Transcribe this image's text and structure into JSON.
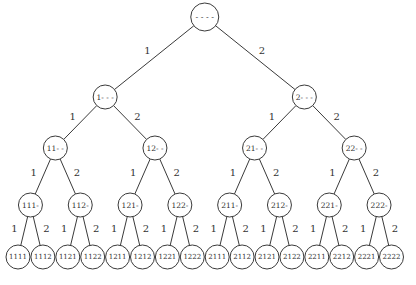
{
  "diagram": {
    "type": "binary-tree",
    "edge_labels": [
      "1",
      "2"
    ],
    "levels": [
      [
        "- - - -"
      ],
      [
        "1- - -",
        "2- - -"
      ],
      [
        "11- -",
        "12- -",
        "21- -",
        "22- -"
      ],
      [
        "111-",
        "112-",
        "121-",
        "122-",
        "211-",
        "212-",
        "221-",
        "222-"
      ],
      [
        "1111",
        "1112",
        "1121",
        "1122",
        "1211",
        "1212",
        "1221",
        "1222",
        "2111",
        "2112",
        "2121",
        "2122",
        "2211",
        "2212",
        "2221",
        "2222"
      ]
    ]
  }
}
